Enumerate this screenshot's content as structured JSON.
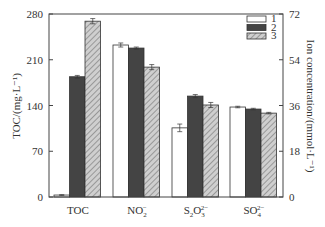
{
  "chart_data": {
    "type": "bar",
    "title": "",
    "categories": [
      "TOC",
      "NO2-",
      "S2O3 2-",
      "SO4 2-"
    ],
    "category_labels": [
      {
        "base": "TOC",
        "sub": "",
        "sup": ""
      },
      {
        "base": "NO",
        "sub": "2",
        "sup": "−"
      },
      {
        "base": "S",
        "sub": "2",
        "mid": "O",
        "sub2": "3",
        "sup": "2−"
      },
      {
        "base": "SO",
        "sub": "4",
        "sup": "2−"
      }
    ],
    "series": [
      {
        "name": "1",
        "values": [
          3,
          59.8,
          27.2,
          35.4
        ],
        "errors": [
          0.5,
          0.8,
          1.5,
          0.3
        ],
        "style": "white"
      },
      {
        "name": "2",
        "values": [
          184,
          58.6,
          39.7,
          34.6
        ],
        "errors": [
          2,
          0.4,
          0.6,
          0.3
        ],
        "style": "dark"
      },
      {
        "name": "3",
        "values": [
          269,
          51.1,
          36.2,
          33.0
        ],
        "errors": [
          4,
          1.0,
          1.0,
          0.3
        ],
        "style": "hatched"
      }
    ],
    "left_axis": {
      "label": "TOC/(mg·L⁻¹)",
      "ylim": [
        0,
        280
      ],
      "ticks": [
        "0",
        "70",
        "140",
        "210",
        "280"
      ]
    },
    "right_axis": {
      "label": "Ion concentration/(mmol·L⁻¹)",
      "ylim": [
        0,
        72
      ],
      "ticks": [
        "0",
        "18",
        "36",
        "54",
        "72"
      ]
    },
    "xlabel": "",
    "legend": {
      "position": "upper right",
      "entries": [
        "1",
        "2",
        "3"
      ]
    },
    "grid": false
  },
  "colors": {
    "axis": "#444444",
    "bar_white": "#ffffff",
    "bar_dark": "#444444",
    "bar_hatch_bg": "#c8c8c8",
    "bar_hatch_line": "#8a8a8a"
  }
}
